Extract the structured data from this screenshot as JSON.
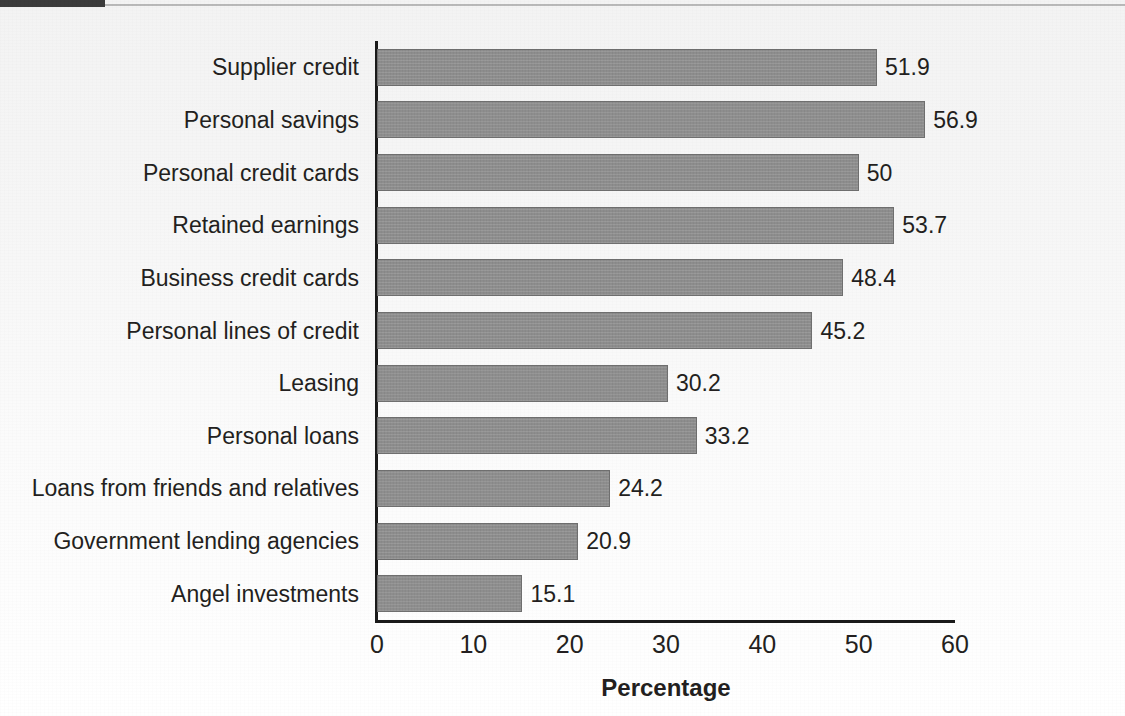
{
  "figure": {
    "background_color": "#f7f7f7",
    "bar_color": "#8e8e8e",
    "bar_border_color": "#6f6f6f",
    "axis_color": "#1a1a1a",
    "text_color": "#231f20",
    "header_stub_color": "#3c3c3c"
  },
  "chart_data": {
    "type": "bar",
    "orientation": "horizontal",
    "title": "",
    "xlabel": "Percentage",
    "ylabel": "",
    "xlim": [
      0,
      60
    ],
    "xticks": [
      0,
      10,
      20,
      30,
      40,
      50,
      60
    ],
    "xtick_labels": [
      "0",
      "10",
      "20",
      "30",
      "40",
      "50",
      "60"
    ],
    "grid": false,
    "legend": false,
    "categories": [
      "Supplier credit",
      "Personal savings",
      "Personal credit cards",
      "Retained earnings",
      "Business credit cards",
      "Personal lines of credit",
      "Leasing",
      "Personal loans",
      "Loans from friends and relatives",
      "Government lending agencies",
      "Angel investments"
    ],
    "values": [
      51.9,
      56.9,
      50,
      53.7,
      48.4,
      45.2,
      30.2,
      33.2,
      24.2,
      20.9,
      15.1
    ],
    "value_labels": [
      "51.9",
      "56.9",
      "50",
      "53.7",
      "48.4",
      "45.2",
      "30.2",
      "33.2",
      "24.2",
      "20.9",
      "15.1"
    ]
  }
}
